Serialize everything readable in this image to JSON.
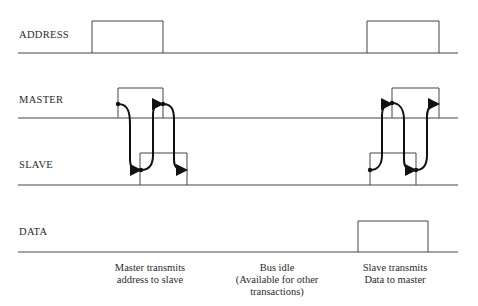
{
  "signals": [
    {
      "name": "ADDRESS",
      "label_y": 35
    },
    {
      "name": "MASTER",
      "label_y": 100
    },
    {
      "name": "SLAVE",
      "label_y": 165
    },
    {
      "name": "DATA",
      "label_y": 232
    }
  ],
  "captions": [
    {
      "lines": [
        "Master transmits",
        "address to slave"
      ],
      "x": 140
    },
    {
      "lines": [
        "Bus idle",
        "(Available for other",
        "transactions)"
      ],
      "x": 272
    },
    {
      "lines": [
        "Slave transmits",
        "Data to master"
      ],
      "x": 400
    }
  ],
  "colors": {
    "line": "#444444",
    "arrow": "#111111"
  }
}
